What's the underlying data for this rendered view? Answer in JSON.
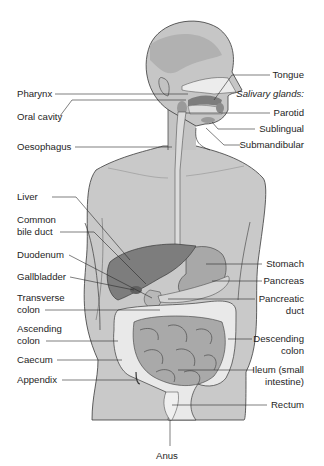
{
  "diagram": {
    "colors": {
      "background": "#ffffff",
      "skin": "#c9c9c9",
      "skin_dark": "#b4b4b4",
      "organ_dark": "#7d7d7d",
      "organ_mid": "#9c9c9c",
      "intestine": "#a9a9a9",
      "colon": "#e9e9e9",
      "outline": "#3a3a3a",
      "leader": "#2a2a2a",
      "text": "#1e1e1e"
    },
    "labels_left": [
      {
        "id": "pharynx",
        "text": "Pharynx"
      },
      {
        "id": "oral-cavity",
        "text": "Oral cavity"
      },
      {
        "id": "oesophagus",
        "text": "Oesophagus"
      },
      {
        "id": "liver",
        "text": "Liver"
      },
      {
        "id": "common-bile-duct",
        "text": "Common\nbile duct"
      },
      {
        "id": "duodenum",
        "text": "Duodenum"
      },
      {
        "id": "gallbladder",
        "text": "Gallbladder"
      },
      {
        "id": "transverse-colon",
        "text": "Transverse\ncolon"
      },
      {
        "id": "ascending-colon",
        "text": "Ascending\ncolon"
      },
      {
        "id": "caecum",
        "text": "Caecum"
      },
      {
        "id": "appendix",
        "text": "Appendix"
      }
    ],
    "labels_right": [
      {
        "id": "tongue",
        "text": "Tongue"
      },
      {
        "id": "salivary-glands",
        "text": "Salivary glands:"
      },
      {
        "id": "parotid",
        "text": "Parotid"
      },
      {
        "id": "sublingual",
        "text": "Sublingual"
      },
      {
        "id": "submandibular",
        "text": "Submandibular"
      },
      {
        "id": "stomach",
        "text": "Stomach"
      },
      {
        "id": "pancreas",
        "text": "Pancreas"
      },
      {
        "id": "pancreatic-duct",
        "text": "Pancreatic\nduct"
      },
      {
        "id": "descending-colon",
        "text": "Descending\ncolon"
      },
      {
        "id": "ileum",
        "text": "Ileum (small\nintestine)"
      },
      {
        "id": "rectum",
        "text": "Rectum"
      }
    ],
    "labels_bottom": [
      {
        "id": "anus",
        "text": "Anus"
      }
    ]
  }
}
